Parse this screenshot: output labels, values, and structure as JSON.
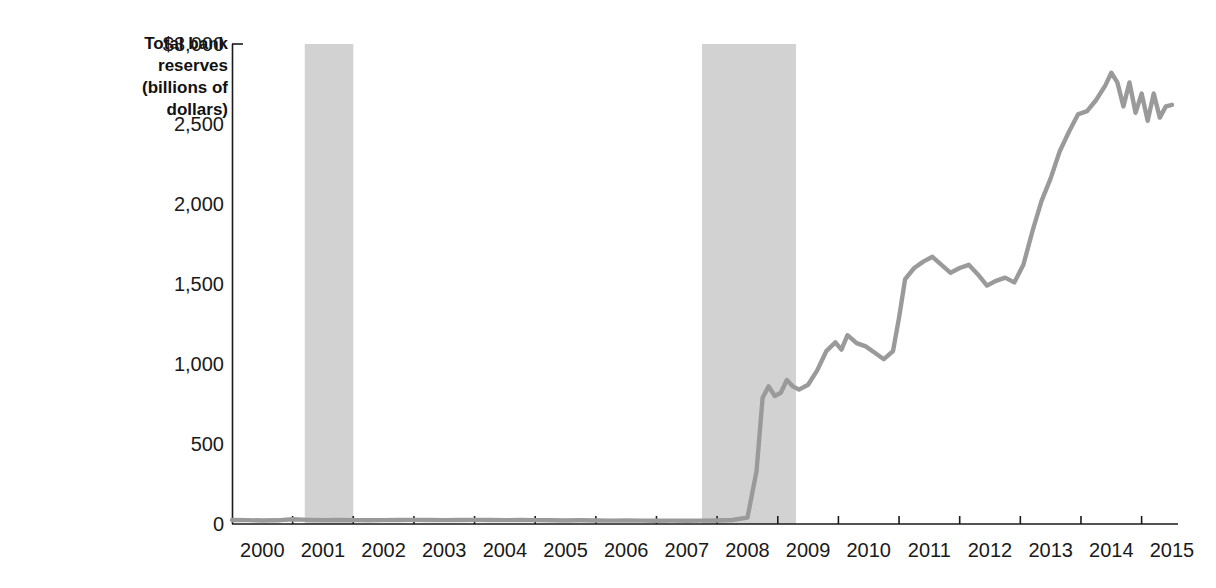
{
  "chart_data": {
    "type": "line",
    "title": "",
    "subtitle": "",
    "ylabel": "Total bank reserves (billions of dollars)",
    "ylabel_lines": [
      "Total bank",
      "reserves",
      "(billions of",
      "dollars)"
    ],
    "xlabel": "",
    "ylim": [
      0,
      3000
    ],
    "xlim": [
      2000,
      2015.6
    ],
    "grid": false,
    "legend": null,
    "ytick_labels": [
      "$3,000",
      "2,500",
      "2,000",
      "1,500",
      "1,000",
      "500",
      "0"
    ],
    "ytick_values": [
      3000,
      2500,
      2000,
      1500,
      1000,
      500,
      0
    ],
    "xtick_labels": [
      "2000",
      "2001",
      "2002",
      "2003",
      "2004",
      "2005",
      "2006",
      "2007",
      "2008",
      "2009",
      "2010",
      "2011",
      "2012",
      "2013",
      "2014",
      "2015"
    ],
    "xtick_values": [
      2000,
      2001,
      2002,
      2003,
      2004,
      2005,
      2006,
      2007,
      2008,
      2009,
      2010,
      2011,
      2012,
      2013,
      2014,
      2015
    ],
    "series": [
      {
        "name": "Total bank reserves",
        "color": "#9a9a9a",
        "x": [
          2000.0,
          2000.25,
          2000.5,
          2000.75,
          2001.0,
          2001.25,
          2001.5,
          2001.75,
          2002.0,
          2002.25,
          2002.5,
          2002.75,
          2003.0,
          2003.25,
          2003.5,
          2003.75,
          2004.0,
          2004.25,
          2004.5,
          2004.75,
          2005.0,
          2005.25,
          2005.5,
          2005.75,
          2006.0,
          2006.25,
          2006.5,
          2006.75,
          2007.0,
          2007.25,
          2007.5,
          2007.75,
          2008.0,
          2008.25,
          2008.5,
          2008.65,
          2008.75,
          2008.85,
          2008.95,
          2009.05,
          2009.15,
          2009.25,
          2009.35,
          2009.5,
          2009.65,
          2009.8,
          2009.95,
          2010.05,
          2010.15,
          2010.3,
          2010.45,
          2010.6,
          2010.75,
          2010.9,
          2011.0,
          2011.1,
          2011.25,
          2011.4,
          2011.55,
          2011.7,
          2011.85,
          2012.0,
          2012.15,
          2012.3,
          2012.45,
          2012.6,
          2012.75,
          2012.9,
          2013.05,
          2013.2,
          2013.35,
          2013.5,
          2013.65,
          2013.8,
          2013.95,
          2014.1,
          2014.25,
          2014.4,
          2014.5,
          2014.6,
          2014.7,
          2014.8,
          2014.9,
          2015.0,
          2015.1,
          2015.2,
          2015.3,
          2015.4,
          2015.5
        ],
        "y": [
          25,
          24,
          22,
          23,
          30,
          26,
          24,
          25,
          24,
          23,
          24,
          25,
          26,
          25,
          24,
          25,
          26,
          25,
          24,
          25,
          24,
          23,
          22,
          23,
          22,
          21,
          22,
          21,
          20,
          21,
          20,
          21,
          22,
          25,
          40,
          330,
          790,
          860,
          800,
          820,
          900,
          860,
          840,
          870,
          960,
          1080,
          1135,
          1090,
          1180,
          1130,
          1110,
          1070,
          1030,
          1080,
          1290,
          1530,
          1600,
          1640,
          1670,
          1620,
          1570,
          1600,
          1620,
          1560,
          1490,
          1520,
          1540,
          1510,
          1620,
          1830,
          2020,
          2160,
          2330,
          2450,
          2560,
          2580,
          2650,
          2740,
          2820,
          2760,
          2610,
          2760,
          2570,
          2690,
          2520,
          2690,
          2540,
          2610,
          2620
        ]
      }
    ],
    "recession_bands": [
      {
        "label": "2001 recession",
        "start": 2001.2,
        "end": 2002.0
      },
      {
        "label": "2008-2009 recession",
        "start": 2007.75,
        "end": 2009.3
      }
    ],
    "band_color": "#d2d2d2"
  }
}
